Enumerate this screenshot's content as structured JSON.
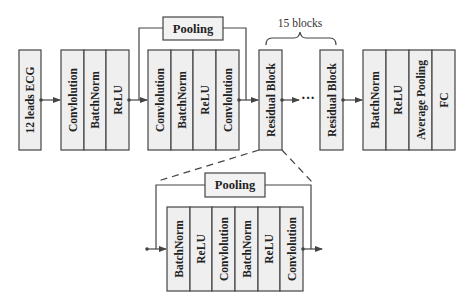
{
  "diagram": {
    "input": {
      "label": "12 leads ECG"
    },
    "stem_block": {
      "layers": [
        "Convlolution",
        "BatchNorm",
        "ReLU"
      ]
    },
    "first_residual_block": {
      "layers": [
        "Convlolution",
        "BatchNorm",
        "ReLU",
        "Convlolution"
      ],
      "shortcut_label": "Pooling"
    },
    "residual_stack": {
      "repeat_label": "15 blocks",
      "block_label": "Residual Block",
      "ellipsis": "···"
    },
    "head_block": {
      "layers": [
        "BatchNorm",
        "ReLU",
        "Average Pooling",
        "FC"
      ]
    },
    "residual_detail": {
      "layers": [
        "BatchNorm",
        "ReLU",
        "Convlolution",
        "BatchNorm",
        "ReLU",
        "Convlolution"
      ],
      "shortcut_label": "Pooling"
    }
  }
}
